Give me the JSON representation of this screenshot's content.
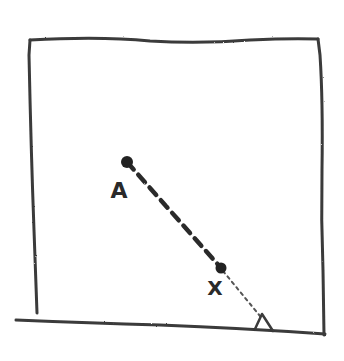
{
  "diagram": {
    "type": "hand-drawn sketch",
    "stroke_color": "#3a3a3a",
    "background": "#ffffff",
    "room": {
      "top_left": [
        28,
        38
      ],
      "top_right": [
        318,
        38
      ],
      "bottom_right": [
        323,
        335
      ],
      "bottom_left_wall_end": [
        37,
        313
      ]
    },
    "floor": {
      "start": [
        15,
        320
      ],
      "end": [
        325,
        333
      ]
    },
    "points": [
      {
        "id": "A",
        "label": "A",
        "position": [
          127,
          162
        ],
        "label_position": [
          119,
          192
        ]
      },
      {
        "id": "X",
        "label": "X",
        "position": [
          221,
          268
        ],
        "label_position": [
          215,
          288
        ]
      }
    ],
    "segments": [
      {
        "from": "A",
        "to": "X",
        "style": "dashed-heavy"
      },
      {
        "from": "X",
        "to": "triangle",
        "style": "dotted-light"
      }
    ],
    "triangle": {
      "label": "",
      "vertices": [
        [
          262,
          314
        ],
        [
          255,
          328
        ],
        [
          272,
          330
        ]
      ]
    }
  }
}
